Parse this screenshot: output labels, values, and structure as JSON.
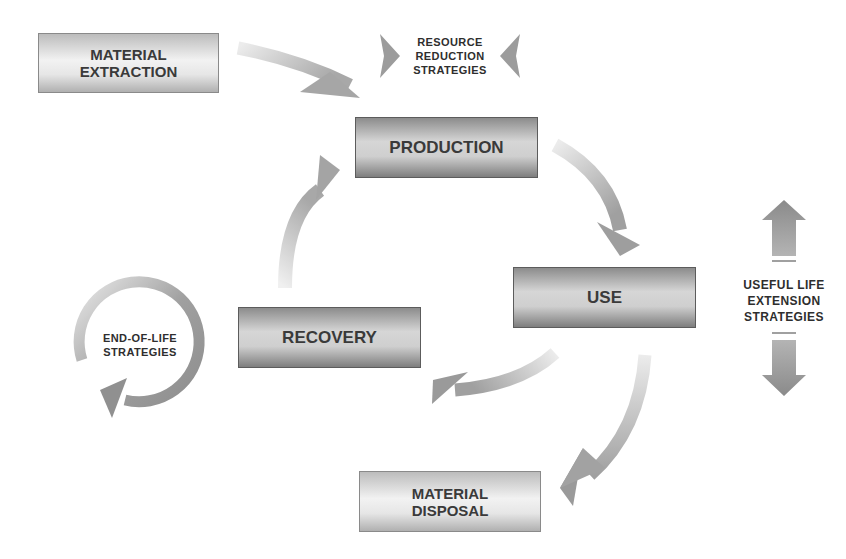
{
  "diagram": {
    "nodes": {
      "material_extraction": [
        "MATERIAL",
        "EXTRACTION"
      ],
      "production": "PRODUCTION",
      "use": "USE",
      "recovery": "RECOVERY",
      "material_disposal": [
        "MATERIAL",
        "DISPOSAL"
      ]
    },
    "annotations": {
      "resource_reduction": [
        "RESOURCE",
        "REDUCTION",
        "STRATEGIES"
      ],
      "useful_life_extension": [
        "USEFUL LIFE",
        "EXTENSION",
        "STRATEGIES"
      ],
      "end_of_life": [
        "END-OF-LIFE",
        "STRATEGIES"
      ]
    },
    "edges": [
      {
        "from": "MATERIAL EXTRACTION",
        "to": "PRODUCTION"
      },
      {
        "from": "PRODUCTION",
        "to": "USE"
      },
      {
        "from": "USE",
        "to": "RECOVERY"
      },
      {
        "from": "USE",
        "to": "MATERIAL DISPOSAL"
      },
      {
        "from": "RECOVERY",
        "to": "PRODUCTION"
      }
    ],
    "colors": {
      "arrow": "#9a9a9a",
      "arrow_light": "#e0e0e0",
      "text": "#3a3a3a"
    }
  }
}
